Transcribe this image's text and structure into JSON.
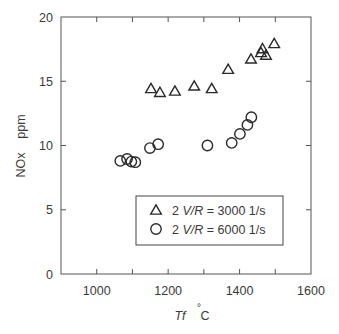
{
  "chart_data": {
    "type": "scatter",
    "title": "",
    "xlabel": "Tf  °C",
    "xlabel_italic_part": "Tf",
    "xlabel_unit": "°C",
    "ylabel": "NOx    ppm",
    "xlim": [
      900,
      1600
    ],
    "ylim": [
      0,
      20
    ],
    "xticks": [
      1000,
      1200,
      1400,
      1600
    ],
    "xticks_minor": [
      1100,
      1300,
      1500
    ],
    "yticks": [
      0,
      5,
      10,
      15,
      20
    ],
    "grid": false,
    "legend_position": "lower right (inside plot)",
    "series": [
      {
        "name": "2 V/R = 3000  1/s",
        "marker": "triangle",
        "points": [
          {
            "x": 1152,
            "y": 14.4
          },
          {
            "x": 1177,
            "y": 14.1
          },
          {
            "x": 1219,
            "y": 14.2
          },
          {
            "x": 1273,
            "y": 14.6
          },
          {
            "x": 1322,
            "y": 14.4
          },
          {
            "x": 1368,
            "y": 15.9
          },
          {
            "x": 1432,
            "y": 16.7
          },
          {
            "x": 1460,
            "y": 17.2
          },
          {
            "x": 1464,
            "y": 17.5
          },
          {
            "x": 1474,
            "y": 17.0
          },
          {
            "x": 1497,
            "y": 17.9
          }
        ]
      },
      {
        "name": "2 V/R = 6000  1/s",
        "marker": "circle",
        "points": [
          {
            "x": 1066,
            "y": 8.8
          },
          {
            "x": 1085,
            "y": 8.95
          },
          {
            "x": 1097,
            "y": 8.75
          },
          {
            "x": 1108,
            "y": 8.7
          },
          {
            "x": 1149,
            "y": 9.8
          },
          {
            "x": 1172,
            "y": 10.1
          },
          {
            "x": 1310,
            "y": 10.0
          },
          {
            "x": 1378,
            "y": 10.2
          },
          {
            "x": 1401,
            "y": 10.9
          },
          {
            "x": 1422,
            "y": 11.6
          },
          {
            "x": 1433,
            "y": 12.2
          }
        ]
      }
    ]
  },
  "legend": {
    "items": [
      {
        "marker": "triangle",
        "prefix": "2 ",
        "italic": "V/R",
        "suffix": " = 3000  1/s"
      },
      {
        "marker": "circle",
        "prefix": "2 ",
        "italic": "V/R",
        "suffix": " = 6000  1/s"
      }
    ]
  },
  "axes": {
    "x_label_var": "Tf",
    "x_label_unit_deg": "°",
    "x_label_unit": "C",
    "y_label": "NOx    ppm"
  }
}
